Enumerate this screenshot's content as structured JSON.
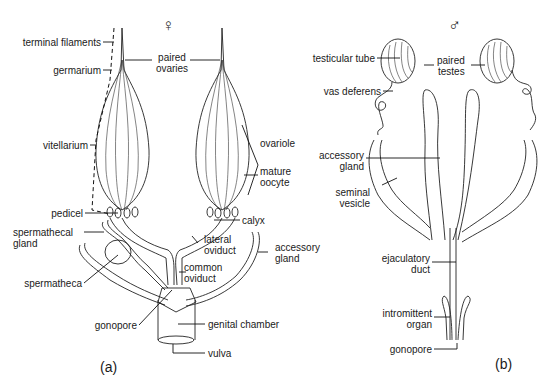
{
  "figure": {
    "female": {
      "symbol": "♀",
      "panel_label": "(a)",
      "labels": {
        "terminal_filaments": "terminal filaments",
        "germarium": "germarium",
        "vitellarium": "vitellarium",
        "paired_ovaries_1": "paired",
        "paired_ovaries_2": "ovaries",
        "ovariole": "ovariole",
        "mature_oocyte_1": "mature",
        "mature_oocyte_2": "oocyte",
        "pedicel": "pedicel",
        "calyx": "calyx",
        "spermathecal_gland_1": "spermathecal",
        "spermathecal_gland_2": "gland",
        "lateral_oviduct_1": "lateral",
        "lateral_oviduct_2": "oviduct",
        "accessory_gland_1": "accessory",
        "accessory_gland_2": "gland",
        "common_oviduct_1": "common",
        "common_oviduct_2": "oviduct",
        "spermatheca": "spermatheca",
        "gonopore": "gonopore",
        "genital_chamber": "genital chamber",
        "vulva": "vulva"
      }
    },
    "male": {
      "symbol": "♂",
      "panel_label": "(b)",
      "labels": {
        "testicular_tube": "testicular tube",
        "paired_testes_1": "paired",
        "paired_testes_2": "testes",
        "vas_deferens": "vas deferens",
        "accessory_gland_1": "accessory",
        "accessory_gland_2": "gland",
        "seminal_vesicle_1": "seminal",
        "seminal_vesicle_2": "vesicle",
        "ejaculatory_duct_1": "ejaculatory",
        "ejaculatory_duct_2": "duct",
        "intromittent_organ_1": "intromittent",
        "intromittent_organ_2": "organ",
        "gonopore": "gonopore"
      }
    }
  }
}
